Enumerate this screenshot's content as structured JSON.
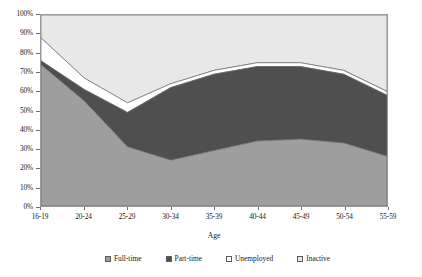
{
  "chart_data": {
    "type": "area",
    "stacked": true,
    "title": "",
    "xlabel": "Age",
    "ylabel": "",
    "categories": [
      "16-19",
      "20-24",
      "25-29",
      "30-34",
      "35-39",
      "40-44",
      "45-49",
      "50-54",
      "55-59"
    ],
    "ylim": [
      0,
      100
    ],
    "ytick_labels": [
      "0%",
      "10%",
      "20%",
      "30%",
      "40%",
      "50%",
      "60%",
      "70%",
      "80%",
      "90%",
      "100%"
    ],
    "ytick_values": [
      0,
      10,
      20,
      30,
      40,
      50,
      60,
      70,
      80,
      90,
      100
    ],
    "grid": false,
    "legend_position": "bottom",
    "series": [
      {
        "name": "Full-time",
        "color": "#9e9e9e",
        "values": [
          74,
          55,
          31,
          24,
          29,
          34,
          35,
          33,
          26
        ]
      },
      {
        "name": "Part-time",
        "color": "#4f4f4f",
        "values": [
          2,
          6,
          18,
          38,
          40,
          39,
          38,
          36,
          32
        ]
      },
      {
        "name": "Unemployed",
        "color": "#ffffff",
        "values": [
          12,
          6,
          5,
          2,
          2,
          2,
          2,
          2,
          2
        ]
      },
      {
        "name": "Inactive",
        "color": "#e8e8e8",
        "values": [
          12,
          33,
          46,
          36,
          29,
          25,
          25,
          29,
          40
        ]
      }
    ],
    "cumulative_tops": {
      "full_time": [
        74,
        55,
        31,
        24,
        29,
        34,
        35,
        33,
        26
      ],
      "plus_part_time": [
        76,
        61,
        49,
        62,
        69,
        73,
        73,
        69,
        58
      ],
      "plus_unemployed": [
        88,
        67,
        54,
        64,
        71,
        75,
        75,
        71,
        60
      ],
      "plus_inactive": [
        100,
        100,
        100,
        100,
        100,
        100,
        100,
        100,
        100
      ]
    }
  },
  "legend": {
    "items": [
      {
        "label": "Full-time"
      },
      {
        "label": "Part-time"
      },
      {
        "label": "Unemployed"
      },
      {
        "label": "Inactive"
      }
    ]
  },
  "axis": {
    "x_title": "Age"
  }
}
